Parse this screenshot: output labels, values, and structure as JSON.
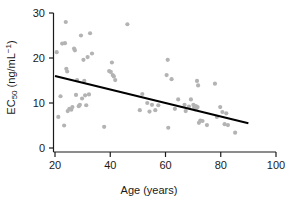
{
  "chart_data": {
    "type": "scatter",
    "title": "",
    "xlabel": "Age (years)",
    "ylabel_parts": {
      "base": "EC",
      "subscript": "50",
      "units_prefix": " (ng/mL",
      "superscript": "−1",
      "units_suffix": ")"
    },
    "ylabel": "EC50 (ng/mL−1)",
    "xlim": [
      16,
      104
    ],
    "ylim": [
      -1.2,
      31
    ],
    "xticks": [
      20,
      40,
      60,
      80,
      100
    ],
    "xtick_labels": [
      "20",
      "40",
      "60",
      "80",
      "100"
    ],
    "yticks": [
      0,
      10,
      20,
      30
    ],
    "ytick_labels": [
      "0",
      "10",
      "20",
      "30"
    ],
    "grid": false,
    "legend": null,
    "marker_color": "#b3b3b3",
    "marker_size": 4.2,
    "axis_color": "#1a1a1a",
    "trendline": {
      "name": "linear fit",
      "color": "#000000",
      "width": 2.0,
      "x": [
        20,
        90
      ],
      "y": [
        16.0,
        5.5
      ],
      "slope": -0.15,
      "intercept": 19.0
    },
    "series": [
      {
        "name": "EC50 by age",
        "points": [
          [
            20.6,
            21.3
          ],
          [
            21.2,
            6.9
          ],
          [
            22.0,
            11.5
          ],
          [
            22.6,
            23.2
          ],
          [
            23.3,
            5.0
          ],
          [
            23.6,
            23.3
          ],
          [
            23.9,
            28.0
          ],
          [
            24.1,
            17.6
          ],
          [
            24.4,
            17.0
          ],
          [
            24.6,
            8.2
          ],
          [
            25.2,
            8.7
          ],
          [
            25.9,
            8.5
          ],
          [
            26.3,
            9.1
          ],
          [
            26.9,
            22.1
          ],
          [
            27.2,
            21.7
          ],
          [
            27.6,
            11.8
          ],
          [
            28.0,
            15.1
          ],
          [
            28.6,
            9.3
          ],
          [
            29.0,
            9.6
          ],
          [
            29.4,
            25.0
          ],
          [
            29.8,
            11.0
          ],
          [
            30.3,
            19.6
          ],
          [
            30.6,
            14.9
          ],
          [
            30.9,
            11.7
          ],
          [
            31.3,
            9.5
          ],
          [
            31.8,
            20.2
          ],
          [
            32.3,
            11.9
          ],
          [
            32.7,
            25.5
          ],
          [
            33.4,
            21.0
          ],
          [
            37.8,
            4.7
          ],
          [
            39.6,
            17.1
          ],
          [
            40.2,
            16.9
          ],
          [
            40.6,
            19.0
          ],
          [
            40.9,
            16.2
          ],
          [
            41.3,
            15.9
          ],
          [
            41.8,
            15.1
          ],
          [
            46.2,
            27.5
          ],
          [
            50.7,
            8.4
          ],
          [
            51.6,
            12.0
          ],
          [
            53.4,
            10.0
          ],
          [
            54.2,
            8.1
          ],
          [
            55.1,
            9.6
          ],
          [
            56.3,
            8.4
          ],
          [
            57.4,
            9.5
          ],
          [
            60.4,
            16.2
          ],
          [
            60.8,
            19.6
          ],
          [
            61.0,
            4.5
          ],
          [
            62.2,
            15.3
          ],
          [
            63.4,
            8.7
          ],
          [
            64.6,
            10.8
          ],
          [
            66.9,
            9.6
          ],
          [
            67.3,
            8.2
          ],
          [
            68.5,
            9.2
          ],
          [
            69.2,
            10.8
          ],
          [
            70.1,
            9.6
          ],
          [
            70.4,
            9.0
          ],
          [
            70.7,
            8.6
          ],
          [
            71.0,
            9.3
          ],
          [
            71.3,
            8.9
          ],
          [
            71.6,
            9.1
          ],
          [
            71.4,
            14.9
          ],
          [
            71.8,
            13.9
          ],
          [
            72.1,
            5.6
          ],
          [
            72.6,
            6.1
          ],
          [
            73.4,
            6.0
          ],
          [
            75.0,
            5.1
          ],
          [
            77.9,
            14.3
          ],
          [
            78.6,
            6.9
          ],
          [
            79.8,
            9.1
          ],
          [
            80.6,
            8.0
          ],
          [
            81.4,
            5.3
          ],
          [
            82.0,
            7.7
          ],
          [
            82.6,
            5.1
          ],
          [
            85.2,
            3.4
          ]
        ]
      }
    ]
  },
  "axes_geometry": {
    "plot_left_px": 55,
    "plot_right_px": 276,
    "plot_bottom_px": 148,
    "plot_top_px": 13
  }
}
